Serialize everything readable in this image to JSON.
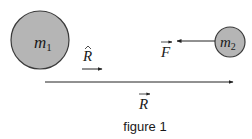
{
  "colors": {
    "mass_fill": "#b5b5b5",
    "mass_stroke": "#3a3a3a",
    "line": "#222222",
    "text": "#1a1a1a"
  },
  "masses": [
    {
      "id": "m1",
      "symbol": "m",
      "subscript": "1"
    },
    {
      "id": "m2",
      "symbol": "m",
      "subscript": "2"
    }
  ],
  "vectors": {
    "force": {
      "symbol": "F",
      "decoration": "vector-arrow",
      "direction": "left"
    },
    "unit": {
      "symbol": "R",
      "decoration": "hat",
      "direction": "right"
    },
    "displacement": {
      "symbol": "R",
      "decoration": "vector-arrow",
      "direction": "right"
    }
  },
  "caption": "figure 1"
}
